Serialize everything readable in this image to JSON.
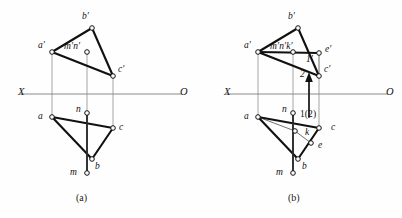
{
  "figure": {
    "colors": {
      "heavy_stroke": "#111111",
      "thin_stroke": "#333333",
      "projector": "#8a8a8a",
      "axis": "#808080",
      "node_fill": "#ffffff",
      "background": "#fefefe"
    },
    "axis": {
      "x_label": "X",
      "o_label": "O"
    },
    "panels": [
      {
        "id": "a",
        "caption": "(a)",
        "labels": [
          {
            "name": "b-prime",
            "text": "b′",
            "x": 82,
            "y": 12
          },
          {
            "name": "a-prime",
            "text": "a′",
            "x": 38,
            "y": 41
          },
          {
            "name": "mn-prime",
            "text": "m′n′",
            "x": 64,
            "y": 42
          },
          {
            "name": "c-prime",
            "text": "c′",
            "x": 118,
            "y": 65
          },
          {
            "name": "n-lower",
            "text": "n",
            "x": 76,
            "y": 105
          },
          {
            "name": "a-lower",
            "text": "a",
            "x": 38,
            "y": 112
          },
          {
            "name": "c-lower",
            "text": "c",
            "x": 119,
            "y": 123
          },
          {
            "name": "b-lower",
            "text": "b",
            "x": 95,
            "y": 162
          },
          {
            "name": "m-lower",
            "text": "m",
            "x": 70,
            "y": 168
          }
        ]
      },
      {
        "id": "b",
        "caption": "(b)",
        "labels": [
          {
            "name": "b-prime",
            "text": "b′",
            "x": 288,
            "y": 12
          },
          {
            "name": "a-prime",
            "text": "a′",
            "x": 244,
            "y": 41
          },
          {
            "name": "mnk-prime",
            "text": "m′n′k′",
            "x": 270,
            "y": 42
          },
          {
            "name": "e-prime",
            "text": "e′",
            "x": 325,
            "y": 45
          },
          {
            "name": "one-prime",
            "text": "1′",
            "x": 306,
            "y": 55
          },
          {
            "name": "two-prime",
            "text": "2′",
            "x": 300,
            "y": 70
          },
          {
            "name": "c-prime",
            "text": "c′",
            "x": 324,
            "y": 65
          },
          {
            "name": "n-lower",
            "text": "n",
            "x": 282,
            "y": 105
          },
          {
            "name": "one-two",
            "text": "1(2)",
            "x": 300,
            "y": 110
          },
          {
            "name": "a-lower",
            "text": "a",
            "x": 244,
            "y": 112
          },
          {
            "name": "k-lower",
            "text": "k",
            "x": 305,
            "y": 128
          },
          {
            "name": "c-lower",
            "text": "c",
            "x": 331,
            "y": 123
          },
          {
            "name": "e-lower",
            "text": "e",
            "x": 318,
            "y": 141
          },
          {
            "name": "b-lower",
            "text": "b",
            "x": 302,
            "y": 162
          },
          {
            "name": "m-lower",
            "text": "m",
            "x": 276,
            "y": 168
          }
        ]
      }
    ],
    "geometry": {
      "panel_a": {
        "axis_y": 94,
        "axis_x1": 20,
        "axis_x2": 182,
        "points": {
          "a_prime": [
            52,
            52
          ],
          "b_prime": [
            92,
            28
          ],
          "c_prime": [
            113,
            76
          ],
          "mn_prime": [
            87,
            52
          ],
          "a": [
            52,
            117
          ],
          "b": [
            92,
            159
          ],
          "c": [
            113,
            128
          ],
          "n": [
            87,
            113
          ],
          "m": [
            87,
            173
          ]
        }
      },
      "panel_b": {
        "axis_y": 94,
        "axis_x1": 226,
        "axis_x2": 388,
        "points": {
          "a_prime": [
            258,
            52
          ],
          "b_prime": [
            298,
            28
          ],
          "c_prime": [
            319,
            76
          ],
          "mnk_prime": [
            293,
            52
          ],
          "e_prime": [
            319,
            53
          ],
          "one_prime": [
            302,
            58
          ],
          "two_prime": [
            308,
            72
          ],
          "a": [
            258,
            117
          ],
          "b": [
            298,
            159
          ],
          "c": [
            319,
            128
          ],
          "n": [
            293,
            113
          ],
          "m": [
            293,
            173
          ],
          "k": [
            295,
            131
          ],
          "e": [
            311,
            143
          ],
          "one_two": [
            307,
            117
          ]
        }
      }
    }
  }
}
